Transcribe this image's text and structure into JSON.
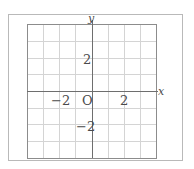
{
  "diagram": {
    "type": "coordinate-grid",
    "axes": {
      "x_label": "x",
      "y_label": "y",
      "origin_label": "O"
    },
    "grid": {
      "x_min": -4,
      "x_max": 4,
      "y_min": -4,
      "y_max": 4,
      "step": 1,
      "columns": 8,
      "rows": 8
    },
    "tick_labels": {
      "x": [
        {
          "value": -2,
          "text": "−2"
        },
        {
          "value": 2,
          "text": "2"
        }
      ],
      "y": [
        {
          "value": 2,
          "text": "2"
        },
        {
          "value": -2,
          "text": "−2"
        }
      ]
    },
    "colors": {
      "grid_line": "#d4d4d4",
      "axis_line": "#6e6e6e",
      "border": "#8c8c8c",
      "frame": "#b9b9b9",
      "text": "#4a4a4a"
    }
  }
}
